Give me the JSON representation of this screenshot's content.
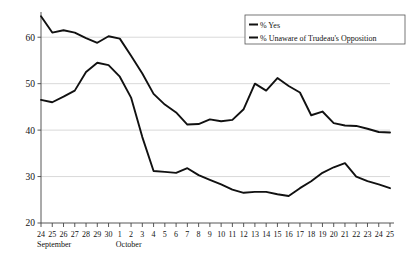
{
  "chart_data": {
    "type": "line",
    "title": "",
    "subtitle": "",
    "xlabel": "",
    "ylabel": "",
    "ylim": [
      20,
      65
    ],
    "yticks": [
      20,
      30,
      40,
      50,
      60
    ],
    "grid": true,
    "grid_axis": "y",
    "legend_position": "top-right",
    "x_tick_labels": [
      "24",
      "25",
      "26",
      "27",
      "28",
      "29",
      "30",
      "1",
      "2",
      "3",
      "4",
      "5",
      "6",
      "7",
      "8",
      "9",
      "10",
      "11",
      "12",
      "13",
      "14",
      "15",
      "16",
      "17",
      "18",
      "19",
      "20",
      "21",
      "22",
      "23",
      "24",
      "25"
    ],
    "x_group_labels": [
      {
        "label": "September",
        "start_index": 0
      },
      {
        "label": "October",
        "start_index": 7
      }
    ],
    "series": [
      {
        "name": "% Yes",
        "color": "#111111",
        "values": [
          64.5,
          61.0,
          61.5,
          61.0,
          59.8,
          58.8,
          60.2,
          59.7,
          56.0,
          52.2,
          47.8,
          45.5,
          43.8,
          41.2,
          41.3,
          42.3,
          41.9,
          42.2,
          44.5,
          50.0,
          48.5,
          51.2,
          49.5,
          48.1,
          43.2,
          44.0,
          41.5,
          41.0,
          40.9,
          40.3,
          39.6,
          39.5
        ]
      },
      {
        "name": "% Unaware of Trudeau's Opposition",
        "color": "#111111",
        "values": [
          46.5,
          46.0,
          47.2,
          48.5,
          52.5,
          54.5,
          54.0,
          51.5,
          47.0,
          38.5,
          31.2,
          31.0,
          30.8,
          31.8,
          30.3,
          29.3,
          28.3,
          27.2,
          26.5,
          26.7,
          26.7,
          26.2,
          25.8,
          27.5,
          29.0,
          30.8,
          32.0,
          32.9,
          30.0,
          29.0,
          28.3,
          27.5
        ]
      }
    ],
    "legend_entries": [
      {
        "label": "% Yes",
        "marker": "line",
        "color": "#111111"
      },
      {
        "label": "% Unaware of Trudeau's Opposition",
        "marker": "line",
        "color": "#111111"
      }
    ]
  },
  "axes": {
    "y_axis_name": "percent-axis",
    "x_axis_name": "date-axis"
  }
}
